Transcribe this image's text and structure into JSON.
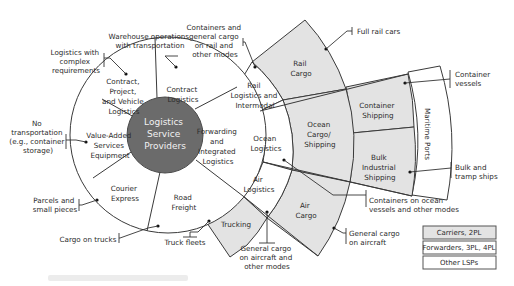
{
  "diagram": {
    "center": {
      "lines": [
        "Logistics",
        "Service",
        "Providers"
      ]
    },
    "inner_ring": [
      {
        "id": "contract-project-vehicle",
        "lines": [
          "Contract,",
          "Project,",
          "and Vehicle",
          "Logistics"
        ]
      },
      {
        "id": "contract-logistics",
        "lines": [
          "Contract",
          "Logistics"
        ]
      },
      {
        "id": "forwarding",
        "lines": [
          "Forwarding",
          "and",
          "Integrated",
          "Logistics"
        ]
      },
      {
        "id": "road-freight",
        "lines": [
          "Road",
          "Freight"
        ]
      },
      {
        "id": "courier-express",
        "lines": [
          "Courier",
          "Express"
        ]
      },
      {
        "id": "value-added",
        "lines": [
          "Value-Added",
          "Services",
          "Equipment"
        ]
      }
    ],
    "forwarding_ring": [
      {
        "id": "rail-logistics",
        "lines": [
          "Rail",
          "Logistics and",
          "Intermodal"
        ]
      },
      {
        "id": "ocean-logistics",
        "lines": [
          "Ocean",
          "Logistics"
        ]
      },
      {
        "id": "air-logistics",
        "lines": [
          "Air",
          "Logistics"
        ]
      }
    ],
    "carrier_ring": [
      {
        "id": "rail-cargo",
        "lines": [
          "Rail",
          "Cargo"
        ]
      },
      {
        "id": "ocean-cargo",
        "lines": [
          "Ocean",
          "Cargo/",
          "Shipping"
        ]
      },
      {
        "id": "air-cargo",
        "lines": [
          "Air",
          "Cargo"
        ]
      },
      {
        "id": "trucking",
        "lines": [
          "Trucking"
        ]
      }
    ],
    "shipping_ring": [
      {
        "id": "container-shipping",
        "lines": [
          "Container",
          "Shipping"
        ]
      },
      {
        "id": "bulk-shipping",
        "lines": [
          "Bulk",
          "Industrial",
          "Shipping"
        ]
      }
    ],
    "maritime_ports": {
      "label": "Maritime Ports"
    },
    "annotations": [
      {
        "id": "warehouse",
        "lines": [
          "Warehouse operations",
          "with transportation"
        ]
      },
      {
        "id": "complex",
        "lines": [
          "Logistics with",
          "complex",
          "requirements"
        ]
      },
      {
        "id": "containers-rail",
        "lines": [
          "Containers and",
          "general cargo",
          "on rail and",
          "other modes"
        ]
      },
      {
        "id": "full-rail",
        "lines": [
          "Full rail cars"
        ]
      },
      {
        "id": "container-vessels",
        "lines": [
          "Container",
          "vessels"
        ]
      },
      {
        "id": "no-transport",
        "lines": [
          "No",
          "transportation",
          "(e.g., container",
          "storage)"
        ]
      },
      {
        "id": "parcels",
        "lines": [
          "Parcels and",
          "small pieces"
        ]
      },
      {
        "id": "cargo-trucks",
        "lines": [
          "Cargo on trucks"
        ]
      },
      {
        "id": "truck-fleets",
        "lines": [
          "Truck fleets"
        ]
      },
      {
        "id": "general-aircraft-other",
        "lines": [
          "General cargo",
          "on aircraft and",
          "other modes"
        ]
      },
      {
        "id": "containers-ocean",
        "lines": [
          "Containers on ocean",
          "vessels and other modes"
        ]
      },
      {
        "id": "general-aircraft",
        "lines": [
          "General cargo",
          "on aircraft"
        ]
      },
      {
        "id": "bulk-tramp",
        "lines": [
          "Bulk and",
          "tramp ships"
        ]
      }
    ],
    "legend": [
      {
        "label": "Carriers, 2PL",
        "fill": "#e3e3e3"
      },
      {
        "label": "Forwarders, 3PL, 4PL",
        "fill": "#ffffff"
      },
      {
        "label": "Other LSPs",
        "fill": "#ffffff"
      }
    ],
    "colors": {
      "center": "#6b6b6b",
      "carrier_shade": "#e3e3e3",
      "line": "#3a3a3a"
    }
  }
}
